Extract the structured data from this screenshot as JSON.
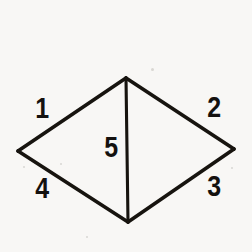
{
  "figure": {
    "background_color": "#f8f7f5",
    "stroke_color": "#17140f",
    "stroke_width": 3.6,
    "vertices": {
      "top": {
        "x": 126,
        "y": 78
      },
      "left": {
        "x": 18,
        "y": 151
      },
      "right": {
        "x": 234,
        "y": 149
      },
      "bottom": {
        "x": 128,
        "y": 222
      }
    },
    "edges": [
      {
        "name": "upper-left-edge",
        "from": "left",
        "to": "top",
        "label": "1"
      },
      {
        "name": "upper-right-edge",
        "from": "top",
        "to": "right",
        "label": "2"
      },
      {
        "name": "lower-right-edge",
        "from": "right",
        "to": "bottom",
        "label": "3"
      },
      {
        "name": "lower-left-edge",
        "from": "bottom",
        "to": "left",
        "label": "4"
      },
      {
        "name": "median-edge",
        "from": "top",
        "to": "bottom",
        "label": "5"
      }
    ],
    "labels": {
      "one": "1",
      "two": "2",
      "three": "3",
      "four": "4",
      "five": "5"
    }
  }
}
